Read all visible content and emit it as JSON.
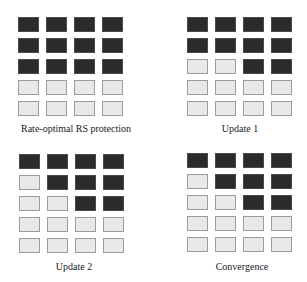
{
  "colors": {
    "protected": "#2b2b2b",
    "unprotected": "#e8e8e8",
    "unprotected_border": "#9c9c9c",
    "background": "#ffffff"
  },
  "grid": {
    "rows": 5,
    "cols": 4
  },
  "panels": [
    {
      "label": "Rate-optimal RS protection",
      "cells": [
        [
          1,
          1,
          1,
          1
        ],
        [
          1,
          1,
          1,
          1
        ],
        [
          1,
          1,
          1,
          1
        ],
        [
          0,
          0,
          0,
          0
        ],
        [
          0,
          0,
          0,
          0
        ]
      ]
    },
    {
      "label": "Update 1",
      "cells": [
        [
          1,
          1,
          1,
          1
        ],
        [
          1,
          1,
          1,
          1
        ],
        [
          0,
          0,
          1,
          1
        ],
        [
          0,
          0,
          0,
          0
        ],
        [
          0,
          0,
          0,
          0
        ]
      ]
    },
    {
      "label": "Update 2",
      "cells": [
        [
          1,
          1,
          1,
          1
        ],
        [
          0,
          1,
          1,
          1
        ],
        [
          0,
          0,
          1,
          1
        ],
        [
          0,
          0,
          0,
          0
        ],
        [
          0,
          0,
          0,
          0
        ]
      ]
    },
    {
      "label": "Convergence",
      "cells": [
        [
          1,
          1,
          1,
          1
        ],
        [
          0,
          1,
          1,
          1
        ],
        [
          0,
          0,
          1,
          1
        ],
        [
          0,
          0,
          0,
          0
        ],
        [
          0,
          0,
          0,
          0
        ]
      ]
    }
  ]
}
